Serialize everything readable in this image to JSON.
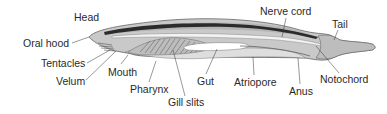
{
  "labels": {
    "head": "Head",
    "oral_hood": "Oral hood",
    "tentacles": "Tentacles",
    "velum": "Velum",
    "mouth": "Mouth",
    "pharynx": "Pharynx",
    "gill_slits": "Gill slits",
    "gut": "Gut",
    "atriopore": "Atriopore",
    "anus": "Anus",
    "notochord": "Notochord",
    "nerve_cord": "Nerve cord",
    "tail": "Tail"
  },
  "colors": {
    "body": "#c8c8c8",
    "body_dark": "#9a9a9a",
    "nerve_cord": "#2b2b2b",
    "gut_lumen": "#ffffff",
    "outline": "#555555",
    "text": "#2a2a2a"
  }
}
